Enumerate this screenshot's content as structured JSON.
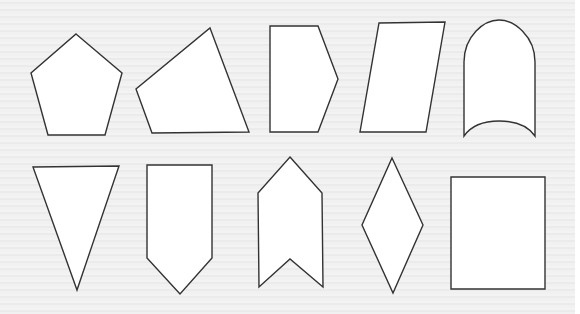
{
  "figure": {
    "background": "#efefef",
    "stroke_color": "#333333",
    "fill_color": "#ffffff",
    "shapes": [
      {
        "name": "pentagon",
        "row": 1,
        "points": "76,34 122,73 105,135 48,135 31,73"
      },
      {
        "name": "irregular-quadrilateral",
        "row": 1,
        "points": "210,28 249,132 152,133 136,89"
      },
      {
        "name": "arrow-pentagon-right",
        "row": 1,
        "points": "270,26 318,26 338,79 318,132 270,132"
      },
      {
        "name": "parallelogram",
        "row": 1,
        "points": "379,23 445,22 426,132 360,132"
      },
      {
        "name": "arch-shape",
        "row": 1,
        "path": "M464,136 L464,62 C464,36 484,20 499,20 C514,20 535,36 535,62 L535,136 C528,126 515,121 499,121 C484,121 471,126 464,136 Z"
      },
      {
        "name": "inverted-triangle",
        "row": 2,
        "points": "33,167 119,166 77,290"
      },
      {
        "name": "pentagon-pointing-down",
        "row": 2,
        "points": "147,165 212,165 212,258 180,294 147,258"
      },
      {
        "name": "chevron-up",
        "row": 2,
        "points": "290,157 322,193 323,287 290,259 259,287 258,193"
      },
      {
        "name": "rhombus",
        "row": 2,
        "points": "392,158 423,225 393,293 362,225"
      },
      {
        "name": "rectangle",
        "row": 2,
        "points": "451,177 545,177 545,289 451,289"
      }
    ]
  }
}
